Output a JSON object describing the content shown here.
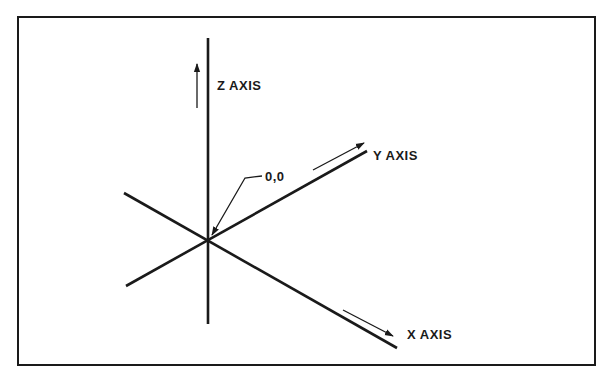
{
  "diagram": {
    "colors": {
      "stroke": "#1a1a1a",
      "background": "#ffffff"
    },
    "origin": {
      "label": "0,0",
      "x": 208,
      "y": 240
    },
    "axes": [
      {
        "id": "z",
        "label": "Z AXIS",
        "line": [
          208,
          38,
          208,
          324
        ],
        "arrow": [
          197,
          108,
          197,
          66
        ],
        "label_pos": [
          217,
          90
        ]
      },
      {
        "id": "y",
        "label": "Y AXIS",
        "line": [
          126,
          286,
          367,
          151
        ],
        "arrow": [
          313,
          170,
          364,
          143
        ],
        "label_pos": [
          373,
          156
        ]
      },
      {
        "id": "x",
        "label": "X AXIS",
        "line": [
          124,
          193,
          397,
          348
        ],
        "arrow": [
          343,
          310,
          392,
          335
        ],
        "label_pos": [
          407,
          335
        ]
      }
    ],
    "leader": {
      "points": "268,176 262,176 245,178 212,235"
    }
  }
}
